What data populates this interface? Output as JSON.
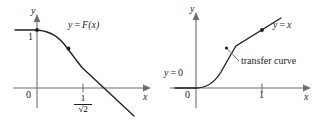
{
  "figure": {
    "background_color": "#ffffff",
    "ink_color": "#231f20",
    "axis_color": "#6d6e71",
    "curve_color": "#231f20"
  },
  "panels": [
    {
      "id": "left",
      "name": "cdf-panel",
      "y_axis_label": "y",
      "x_axis_label": "x",
      "origin_label": "0",
      "y_tick_label": "1",
      "x_tick_fraction": {
        "numerator": "1",
        "denominator_radical": "√",
        "denominator_value": "2"
      },
      "curve_label": {
        "lhs": "y",
        "eq": "=",
        "rhs_fn": "F",
        "rhs_arg": "(x)",
        "full": "y = F(x)"
      },
      "markers": [
        {
          "name": "marker-at-origin-height",
          "x": 0.0,
          "y": 1.0
        },
        {
          "name": "marker-on-curve",
          "x": 0.47,
          "y": 0.89
        }
      ],
      "chart": {
        "type": "line",
        "title": "y = F(x)",
        "xlabel": "x",
        "ylabel": "y",
        "xlim": [
          -0.32,
          2.0
        ],
        "ylim": [
          -0.55,
          1.35
        ],
        "xticks": [
          {
            "value": 0.707,
            "label": "1/√2"
          }
        ],
        "yticks": [
          {
            "value": 1.0,
            "label": "1"
          }
        ],
        "grid": false,
        "legend": "none",
        "x": [
          0.0,
          0.1,
          0.2,
          0.3,
          0.4,
          0.5,
          0.6,
          0.707,
          0.8,
          0.9,
          1.0,
          1.1,
          1.2,
          1.3,
          1.4,
          1.5,
          1.6,
          1.7
        ],
        "y": [
          1.0,
          1.0,
          0.99,
          0.97,
          0.93,
          0.87,
          0.79,
          0.7,
          0.6,
          0.48,
          0.36,
          0.24,
          0.11,
          -0.02,
          -0.15,
          -0.28,
          -0.41,
          -0.54
        ]
      }
    },
    {
      "id": "right",
      "name": "transfer-curve-panel",
      "y_axis_label": "y",
      "x_axis_label": "x",
      "origin_label": "0",
      "x_tick_label": "1",
      "zero_label": {
        "lhs": "y",
        "eq": "=",
        "rhs": "0",
        "full": "y = 0"
      },
      "identity_label": {
        "lhs": "y",
        "eq": "=",
        "rhs": "x",
        "full": "y = x"
      },
      "annotation": "transfer curve",
      "markers": [
        {
          "name": "marker-on-curve-lower",
          "x": 0.56,
          "y": 0.34
        },
        {
          "name": "marker-on-curve-upper",
          "x": 1.28,
          "y": 1.28
        }
      ],
      "chart": {
        "type": "line",
        "title": "transfer curve",
        "xlabel": "x",
        "ylabel": "y",
        "xlim": [
          -0.42,
          1.85
        ],
        "ylim": [
          -0.22,
          1.6
        ],
        "xticks": [
          {
            "value": 1.0,
            "label": "1"
          }
        ],
        "yticks": [],
        "grid": false,
        "legend": "none",
        "annotations": [
          {
            "text": "y = 0",
            "x": -0.33,
            "y": 0.12
          },
          {
            "text": "y = x",
            "x": 1.42,
            "y": 1.37
          },
          {
            "text": "transfer curve",
            "x": 0.78,
            "y": 0.5
          }
        ],
        "x": [
          0.0,
          0.1,
          0.2,
          0.3,
          0.4,
          0.5,
          0.6,
          0.7,
          0.8,
          0.9,
          1.0,
          1.1,
          1.2,
          1.3,
          1.4,
          1.5
        ],
        "y": [
          0.0,
          0.005,
          0.025,
          0.07,
          0.15,
          0.26,
          0.39,
          0.52,
          0.65,
          0.77,
          0.88,
          0.99,
          1.1,
          1.21,
          1.32,
          1.43
        ]
      }
    }
  ]
}
